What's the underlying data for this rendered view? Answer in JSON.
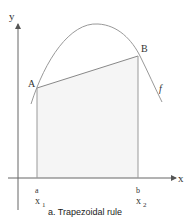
{
  "diagram": {
    "caption": "a. Trapezoidal rule",
    "axes": {
      "x_label": "x",
      "y_label": "y"
    },
    "points": {
      "A": "A",
      "B": "B"
    },
    "curve_label": "f",
    "bounds": {
      "a": "a",
      "b": "b",
      "x1": "x",
      "x1_sub": "1",
      "x2": "x",
      "x2_sub": "2"
    }
  },
  "colors": {
    "line": "#888888",
    "text": "#333333",
    "fill": "#f4f4f4"
  }
}
